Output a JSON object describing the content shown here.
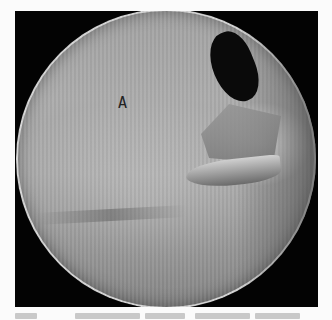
{
  "image": {
    "description": "Circular arthroscopic endoscope view of a joint with instrument and tissue, labeled region",
    "colors": {
      "frame": "#030303",
      "background": "#fbfbfb",
      "label": "#222222"
    },
    "labels": [
      {
        "text": "A"
      }
    ],
    "caption": {
      "visible": "cut off / illegible"
    }
  }
}
